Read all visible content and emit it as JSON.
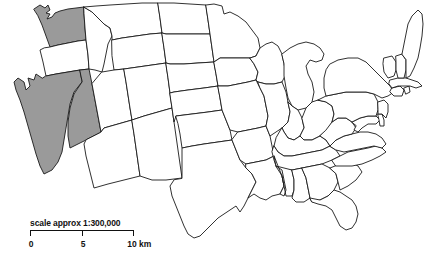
{
  "map": {
    "title": "Contiguous United States outline map",
    "region": "United States",
    "background_color": "#ffffff",
    "outline_color": "#1a1a1a",
    "default_state_fill": "#ffffff",
    "highlight_fill": "#9a9a9a",
    "highlighted_states": [
      "Washington",
      "Nevada",
      "California"
    ],
    "states": [
      {
        "name": "Washington",
        "shaded": true
      },
      {
        "name": "Oregon",
        "shaded": false
      },
      {
        "name": "California",
        "shaded": true
      },
      {
        "name": "Nevada",
        "shaded": true
      },
      {
        "name": "Idaho",
        "shaded": false
      },
      {
        "name": "Montana",
        "shaded": false
      },
      {
        "name": "Wyoming",
        "shaded": false
      },
      {
        "name": "Utah",
        "shaded": false
      },
      {
        "name": "Arizona",
        "shaded": false
      },
      {
        "name": "Colorado",
        "shaded": false
      },
      {
        "name": "New Mexico",
        "shaded": false
      },
      {
        "name": "North Dakota",
        "shaded": false
      },
      {
        "name": "South Dakota",
        "shaded": false
      },
      {
        "name": "Nebraska",
        "shaded": false
      },
      {
        "name": "Kansas",
        "shaded": false
      },
      {
        "name": "Oklahoma",
        "shaded": false
      },
      {
        "name": "Texas",
        "shaded": false
      },
      {
        "name": "Minnesota",
        "shaded": false
      },
      {
        "name": "Iowa",
        "shaded": false
      },
      {
        "name": "Missouri",
        "shaded": false
      },
      {
        "name": "Arkansas",
        "shaded": false
      },
      {
        "name": "Louisiana",
        "shaded": false
      },
      {
        "name": "Wisconsin",
        "shaded": false
      },
      {
        "name": "Illinois",
        "shaded": false
      },
      {
        "name": "Michigan",
        "shaded": false
      },
      {
        "name": "Indiana",
        "shaded": false
      },
      {
        "name": "Ohio",
        "shaded": false
      },
      {
        "name": "Kentucky",
        "shaded": false
      },
      {
        "name": "Tennessee",
        "shaded": false
      },
      {
        "name": "Mississippi",
        "shaded": false
      },
      {
        "name": "Alabama",
        "shaded": false
      },
      {
        "name": "Georgia",
        "shaded": false
      },
      {
        "name": "Florida",
        "shaded": false
      },
      {
        "name": "South Carolina",
        "shaded": false
      },
      {
        "name": "North Carolina",
        "shaded": false
      },
      {
        "name": "Virginia",
        "shaded": false
      },
      {
        "name": "West Virginia",
        "shaded": false
      },
      {
        "name": "Maryland",
        "shaded": false
      },
      {
        "name": "Delaware",
        "shaded": false
      },
      {
        "name": "Pennsylvania",
        "shaded": false
      },
      {
        "name": "New Jersey",
        "shaded": false
      },
      {
        "name": "New York",
        "shaded": false
      },
      {
        "name": "Connecticut",
        "shaded": false
      },
      {
        "name": "Rhode Island",
        "shaded": false
      },
      {
        "name": "Massachusetts",
        "shaded": false
      },
      {
        "name": "Vermont",
        "shaded": false
      },
      {
        "name": "New Hampshire",
        "shaded": false
      },
      {
        "name": "Maine",
        "shaded": false
      }
    ]
  },
  "scale_bar": {
    "caption": "scale approx 1:300,000",
    "ratio": "1:300,000",
    "ticks": [
      {
        "label": "0",
        "position_pct": 0
      },
      {
        "label": "5",
        "position_pct": 50
      },
      {
        "label": "10 km",
        "position_pct": 100
      }
    ],
    "unit": "km",
    "max_value": "10"
  }
}
